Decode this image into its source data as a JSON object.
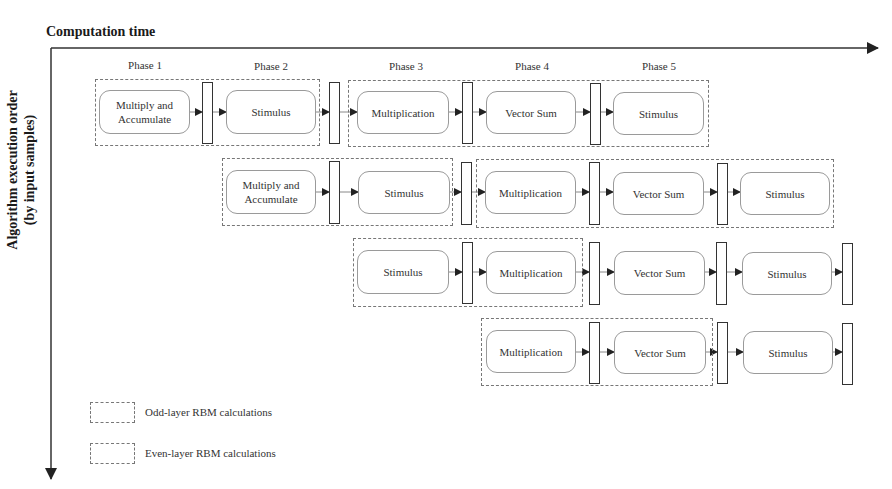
{
  "axes": {
    "x_label": "Computation time",
    "y_label_line1": "Algorithm execution order",
    "y_label_line2": "(by input samples)"
  },
  "phases": [
    "Phase 1",
    "Phase 2",
    "Phase 3",
    "Phase 4",
    "Phase 5"
  ],
  "rows": [
    {
      "stages": [
        "Multiply and Accumulate",
        "Stimulus",
        "Multiplication",
        "Vector Sum",
        "Stimulus"
      ],
      "groups": [
        "odd",
        "even"
      ]
    },
    {
      "stages": [
        "Multiply and Accumulate",
        "Stimulus",
        "Multiplication",
        "Vector Sum",
        "Stimulus"
      ],
      "groups": [
        "odd",
        "even"
      ]
    },
    {
      "stages": [
        "Stimulus",
        "Multiplication",
        "Vector Sum",
        "Stimulus"
      ],
      "groups": [
        "odd"
      ]
    },
    {
      "stages": [
        "Multiplication",
        "Vector Sum",
        "Stimulus"
      ],
      "groups": [
        "odd"
      ]
    }
  ],
  "legend": {
    "odd": "Odd-layer RBM calculations",
    "even": "Even-layer RBM calculations"
  },
  "colors": {
    "axis": "#333333",
    "dashed_border": "#777777",
    "process_border": "#9a9a9a",
    "register_border": "#333333"
  }
}
